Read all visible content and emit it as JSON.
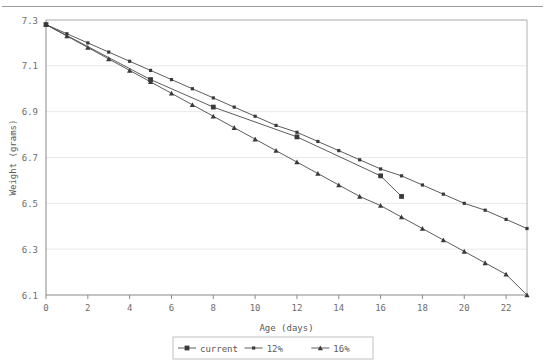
{
  "chart_data": {
    "type": "line",
    "title": "",
    "xlabel": "Age  (days)",
    "ylabel": "Weight  (grams)",
    "xlim": [
      0,
      23
    ],
    "ylim": [
      6.1,
      7.3
    ],
    "xticks": [
      0,
      2,
      4,
      6,
      8,
      10,
      12,
      14,
      16,
      18,
      20,
      22
    ],
    "xtick_labels": [
      "0",
      "2",
      "4",
      "6",
      "8",
      "10",
      "12",
      "14",
      "16",
      "18",
      "20",
      "22"
    ],
    "yticks": [
      6.1,
      6.3,
      6.5,
      6.7,
      6.9,
      7.1,
      7.3
    ],
    "ytick_labels": [
      "6.1",
      "6.3",
      "6.5",
      "6.7",
      "6.9",
      "7.1",
      "7.3"
    ],
    "grid": true,
    "grid_axis": "y",
    "legend_position": "bottom",
    "series": [
      {
        "name": "current",
        "marker": "square",
        "color": "#3a3a3a",
        "x": [
          0,
          5,
          8,
          12,
          16,
          17
        ],
        "values": [
          7.28,
          7.04,
          6.92,
          6.79,
          6.62,
          6.53
        ]
      },
      {
        "name": "12%",
        "marker": "square-small",
        "color": "#3a3a3a",
        "x": [
          0,
          1,
          2,
          3,
          4,
          5,
          6,
          7,
          8,
          9,
          10,
          11,
          12,
          13,
          14,
          15,
          16,
          17,
          18,
          19,
          20,
          21,
          22,
          23
        ],
        "values": [
          7.28,
          7.24,
          7.2,
          7.16,
          7.12,
          7.08,
          7.04,
          7.0,
          6.96,
          6.92,
          6.88,
          6.84,
          6.81,
          6.77,
          6.73,
          6.69,
          6.65,
          6.62,
          6.58,
          6.54,
          6.5,
          6.47,
          6.43,
          6.39
        ]
      },
      {
        "name": "16%",
        "marker": "triangle",
        "color": "#3a3a3a",
        "x": [
          0,
          1,
          2,
          3,
          4,
          5,
          6,
          7,
          8,
          9,
          10,
          11,
          12,
          13,
          14,
          15,
          16,
          17,
          18,
          19,
          20,
          21,
          22,
          23
        ],
        "values": [
          7.28,
          7.23,
          7.18,
          7.13,
          7.08,
          7.03,
          6.98,
          6.93,
          6.88,
          6.83,
          6.78,
          6.73,
          6.68,
          6.63,
          6.58,
          6.53,
          6.49,
          6.44,
          6.39,
          6.34,
          6.29,
          6.24,
          6.19,
          6.1
        ]
      }
    ]
  },
  "legend": {
    "items": [
      {
        "label": "current"
      },
      {
        "label": "12%"
      },
      {
        "label": "16%"
      }
    ]
  }
}
